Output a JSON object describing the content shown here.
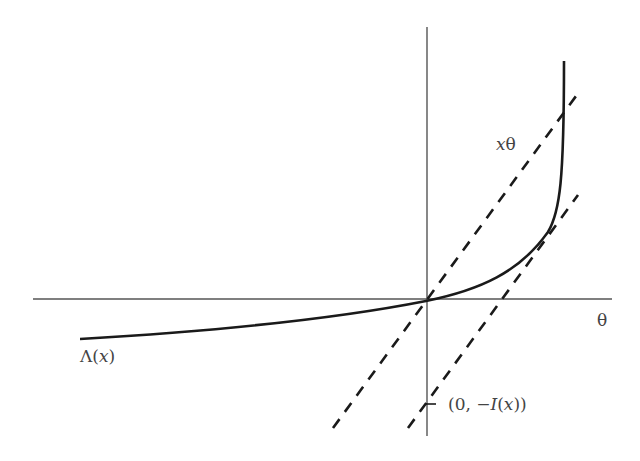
{
  "figure": {
    "type": "diagram",
    "colors": {
      "axis": "#555555",
      "curve": "#1a1a1a",
      "dashed": "#1a1a1a",
      "label": "#444444"
    },
    "labels": {
      "x_axis": "θ",
      "curve": {
        "prefix": "Λ(",
        "var": "x",
        "suffix": ")"
      },
      "line": {
        "var": "x",
        "suffix": "θ"
      },
      "intercept": {
        "prefix": "(0, −",
        "fn": "I",
        "open": "(",
        "var": "x",
        "close": "))"
      }
    },
    "origin": {
      "x": 426,
      "y": 301
    },
    "axes": {
      "horizontal": {
        "x1": 33,
        "x2": 612,
        "y": 299
      },
      "vertical": {
        "x": 427,
        "y1": 27,
        "y2": 436
      }
    },
    "curve_path": "M80,339 C200,332 330,320 426,301 C480,290 520,272 548,232 C560,212 564,180 564,61",
    "dashed_lines": [
      {
        "name": "line-x-theta",
        "x1": 333,
        "y1": 428,
        "x2": 579,
        "y2": 92
      },
      {
        "name": "tangent-line",
        "x1": 408,
        "y1": 428,
        "x2": 578,
        "y2": 195
      }
    ],
    "intercept_point": {
      "x": 426,
      "y": 404
    }
  }
}
